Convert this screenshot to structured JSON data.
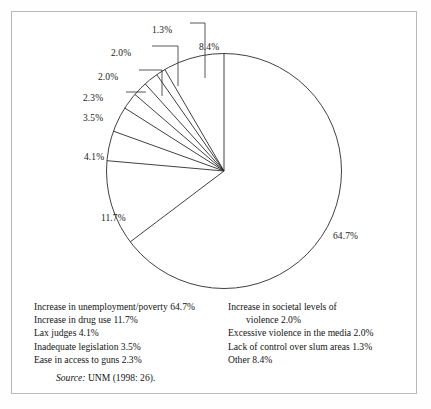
{
  "figure": {
    "source_prefix": "Source:",
    "source_text": "UNM (1998: 26)."
  },
  "chart_data": {
    "type": "pie",
    "title": "",
    "xlabel": "",
    "ylabel": "",
    "legend_position": "below",
    "grid": false,
    "units": "percent",
    "start_angle_deg": 0,
    "direction": "clockwise",
    "categories": [
      "Increase in unemployment/poverty",
      "Increase in drug use",
      "Lax judges",
      "Inadequate legislation",
      "Ease in access to guns",
      "Increase in societal levels of violence",
      "Excessive violence in the media",
      "Lack of control over slum areas",
      "Other"
    ],
    "values": [
      64.7,
      11.7,
      4.1,
      3.5,
      2.3,
      2.0,
      2.0,
      1.3,
      8.4
    ],
    "slice_labels": [
      "64.7%",
      "11.7%",
      "4.1%",
      "3.5%",
      "2.3%",
      "2.0%",
      "2.0%",
      "1.3%",
      "8.4%"
    ],
    "annotations": [
      {
        "text": "64.7%",
        "x": 333,
        "y": 231
      },
      {
        "text": "11.7%",
        "x": 101,
        "y": 213
      },
      {
        "text": "4.1%",
        "x": 84,
        "y": 152
      },
      {
        "text": "3.5%",
        "x": 83,
        "y": 113
      },
      {
        "text": "2.3%",
        "x": 83,
        "y": 93
      },
      {
        "text": "2.0%",
        "x": 98,
        "y": 72
      },
      {
        "text": "2.0%",
        "x": 111,
        "y": 48
      },
      {
        "text": "1.3%",
        "x": 152,
        "y": 25
      },
      {
        "text": "8.4%",
        "x": 199,
        "y": 42
      }
    ]
  },
  "legend": {
    "left_column": [
      {
        "text": "Increase in unemployment/poverty  64.7%",
        "indent": false
      },
      {
        "text": "Increase in drug use  11.7%",
        "indent": false
      },
      {
        "text": "Lax judges  4.1%",
        "indent": false
      },
      {
        "text": "Inadequate legislation  3.5%",
        "indent": false
      },
      {
        "text": "Ease in access to guns  2.3%",
        "indent": false
      }
    ],
    "right_column": [
      {
        "text": "Increase in societal levels of",
        "indent": false
      },
      {
        "text": "violence  2.0%",
        "indent": true
      },
      {
        "text": "Excessive violence in the media  2.0%",
        "indent": false
      },
      {
        "text": "Lack of control over slum areas  1.3%",
        "indent": false
      },
      {
        "text": "Other  8.4%",
        "indent": false
      }
    ]
  },
  "colors": {
    "stroke": "#2b2b2b",
    "frame": "#b9b9b9",
    "text": "#141414",
    "background": "#ffffff"
  }
}
